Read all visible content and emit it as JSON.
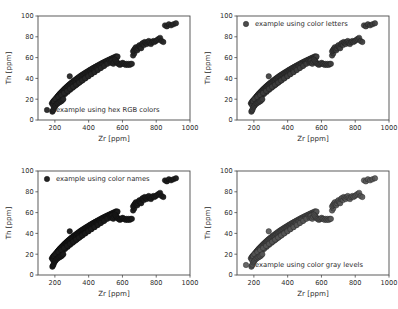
{
  "figure": {
    "background": "#ffffff",
    "rows": 2,
    "cols": 2,
    "axis_color": "#4a4a4a",
    "text_color": "#2b2b2b"
  },
  "chart_data": [
    {
      "type": "scatter",
      "panel": "top-left",
      "title": "",
      "xlabel": "Zr [ppm]",
      "ylabel": "Th [ppm]",
      "xlim": [
        100,
        1000
      ],
      "ylim": [
        0,
        100
      ],
      "xticks": [
        200,
        400,
        600,
        800,
        1000
      ],
      "yticks": [
        0,
        20,
        40,
        60,
        80,
        100
      ],
      "grid": false,
      "legend_position": "lower-left",
      "legend": "example using hex RGB colors",
      "marker": "o",
      "marker_color": "#262626",
      "marker_edge_color": "#141414",
      "marker_size": 4.2,
      "marker_alpha": 0.95
    },
    {
      "type": "scatter",
      "panel": "top-right",
      "title": "",
      "xlabel": "Zr [ppm]",
      "ylabel": "Th [ppm]",
      "xlim": [
        100,
        1000
      ],
      "ylim": [
        0,
        100
      ],
      "xticks": [
        200,
        400,
        600,
        800,
        1000
      ],
      "yticks": [
        0,
        20,
        40,
        60,
        80,
        100
      ],
      "grid": false,
      "legend_position": "upper-left",
      "legend": "example using color letters",
      "marker": "o",
      "marker_color": "#3d3d3d",
      "marker_edge_color": "#1c1c1c",
      "marker_size": 4.2,
      "marker_alpha": 0.92
    },
    {
      "type": "scatter",
      "panel": "bottom-left",
      "title": "",
      "xlabel": "Zr [ppm]",
      "ylabel": "Th [ppm]",
      "xlim": [
        100,
        1000
      ],
      "ylim": [
        0,
        100
      ],
      "xticks": [
        200,
        400,
        600,
        800,
        1000
      ],
      "yticks": [
        0,
        20,
        40,
        60,
        80,
        100
      ],
      "grid": false,
      "legend_position": "upper-left",
      "legend": "example using color names",
      "marker": "o",
      "marker_color": "#1a1a1a",
      "marker_edge_color": "#0d0d0d",
      "marker_size": 4.2,
      "marker_alpha": 0.96
    },
    {
      "type": "scatter",
      "panel": "bottom-right",
      "title": "",
      "xlabel": "Zr [ppm]",
      "ylabel": "Th [ppm]",
      "xlim": [
        100,
        1000
      ],
      "ylim": [
        0,
        100
      ],
      "xticks": [
        200,
        400,
        600,
        800,
        1000
      ],
      "yticks": [
        0,
        20,
        40,
        60,
        80,
        100
      ],
      "grid": false,
      "legend_position": "lower-left",
      "legend": "example using color gray levels",
      "marker": "o",
      "marker_color": "#555555",
      "marker_edge_color": "#262626",
      "marker_size": 4.2,
      "marker_alpha": 0.9
    }
  ],
  "points": {
    "x": [
      182,
      186,
      188,
      190,
      191,
      193,
      195,
      196,
      197,
      199,
      200,
      201,
      203,
      204,
      205,
      206,
      208,
      209,
      210,
      211,
      213,
      214,
      215,
      216,
      218,
      219,
      220,
      221,
      223,
      224,
      225,
      227,
      228,
      229,
      231,
      232,
      234,
      235,
      237,
      238,
      240,
      241,
      243,
      244,
      246,
      247,
      249,
      250,
      252,
      253,
      255,
      257,
      258,
      260,
      261,
      263,
      265,
      266,
      268,
      270,
      271,
      273,
      275,
      276,
      278,
      280,
      282,
      283,
      285,
      287,
      289,
      291,
      292,
      294,
      296,
      298,
      300,
      302,
      304,
      306,
      308,
      310,
      312,
      314,
      316,
      318,
      320,
      322,
      324,
      326,
      328,
      330,
      332,
      334,
      336,
      338,
      340,
      343,
      345,
      347,
      349,
      351,
      354,
      356,
      358,
      360,
      363,
      365,
      367,
      370,
      372,
      374,
      377,
      379,
      382,
      384,
      386,
      389,
      391,
      394,
      396,
      399,
      401,
      404,
      406,
      409,
      411,
      414,
      417,
      419,
      422,
      424,
      427,
      430,
      432,
      435,
      438,
      440,
      443,
      446,
      449,
      451,
      454,
      457,
      460,
      463,
      466,
      468,
      471,
      474,
      477,
      480,
      483,
      486,
      489,
      492,
      495,
      498,
      501,
      504,
      507,
      511,
      514,
      517,
      520,
      523,
      526,
      530,
      533,
      536,
      540,
      543,
      546,
      550,
      553,
      557,
      560,
      564,
      567,
      571,
      190,
      205,
      218,
      232,
      246,
      260,
      275,
      290,
      305,
      320,
      336,
      351,
      367,
      383,
      399,
      415,
      431,
      448,
      464,
      481,
      196,
      212,
      228,
      244,
      261,
      277,
      294,
      311,
      328,
      345,
      362,
      379,
      397,
      414,
      432,
      450,
      468,
      486,
      504,
      522,
      203,
      220,
      237,
      254,
      272,
      289,
      307,
      325,
      343,
      361,
      379,
      398,
      416,
      435,
      454,
      473,
      492,
      511,
      530,
      549,
      288,
      530,
      534,
      538,
      542,
      546,
      551,
      556,
      560,
      565,
      570,
      575,
      580,
      585,
      590,
      596,
      601,
      607,
      613,
      619,
      625,
      631,
      637,
      643,
      650,
      656,
      663,
      670,
      663,
      668,
      672,
      676,
      680,
      684,
      688,
      692,
      697,
      701,
      706,
      711,
      716,
      721,
      727,
      732,
      738,
      744,
      750,
      756,
      762,
      769,
      776,
      783,
      790,
      798,
      806,
      814,
      823,
      832,
      842,
      852,
      863,
      875,
      888,
      902,
      917,
      185,
      188,
      192,
      196,
      200,
      204,
      209,
      213,
      218,
      223,
      228,
      233,
      238,
      244,
      250
    ],
    "y": [
      16,
      16,
      17,
      17,
      18,
      18,
      17,
      18,
      19,
      19,
      18,
      19,
      20,
      20,
      19,
      20,
      21,
      21,
      20,
      21,
      22,
      22,
      21,
      22,
      23,
      23,
      22,
      23,
      24,
      24,
      23,
      24,
      25,
      25,
      24,
      25,
      26,
      26,
      25,
      26,
      27,
      27,
      26,
      27,
      28,
      28,
      27,
      28,
      29,
      29,
      28,
      29,
      30,
      30,
      29,
      30,
      31,
      31,
      30,
      31,
      32,
      32,
      31,
      32,
      33,
      33,
      32,
      33,
      34,
      34,
      33,
      34,
      35,
      35,
      34,
      35,
      36,
      36,
      35,
      36,
      37,
      37,
      36,
      37,
      38,
      38,
      37,
      38,
      39,
      39,
      38,
      39,
      40,
      40,
      39,
      40,
      41,
      41,
      40,
      41,
      42,
      42,
      41,
      42,
      43,
      43,
      42,
      43,
      44,
      44,
      43,
      44,
      45,
      45,
      44,
      45,
      46,
      46,
      45,
      46,
      47,
      47,
      46,
      47,
      48,
      48,
      47,
      48,
      49,
      49,
      48,
      49,
      50,
      50,
      49,
      50,
      51,
      51,
      50,
      51,
      52,
      52,
      51,
      52,
      53,
      53,
      52,
      53,
      54,
      54,
      53,
      54,
      55,
      55,
      54,
      55,
      56,
      56,
      55,
      56,
      57,
      57,
      56,
      57,
      58,
      58,
      57,
      58,
      59,
      59,
      58,
      59,
      60,
      60,
      59,
      60,
      61,
      61,
      60,
      61,
      14,
      17,
      19,
      21,
      23,
      25,
      27,
      29,
      31,
      33,
      35,
      37,
      39,
      41,
      43,
      45,
      47,
      49,
      51,
      53,
      18,
      20,
      22,
      24,
      26,
      28,
      30,
      32,
      34,
      36,
      38,
      40,
      42,
      44,
      46,
      48,
      50,
      52,
      54,
      56,
      20,
      22,
      24,
      26,
      28,
      30,
      32,
      34,
      36,
      38,
      40,
      42,
      44,
      46,
      48,
      50,
      52,
      54,
      56,
      58,
      42,
      55,
      56,
      57,
      55,
      54,
      56,
      58,
      57,
      56,
      55,
      54,
      54,
      53,
      54,
      54,
      55,
      54,
      54,
      53,
      54,
      53,
      54,
      53,
      54,
      54,
      62,
      64,
      66,
      67,
      68,
      69,
      70,
      68,
      67,
      69,
      71,
      72,
      70,
      69,
      73,
      74,
      72,
      75,
      74,
      73,
      75,
      76,
      74,
      73,
      75,
      76,
      75,
      76,
      77,
      78,
      79,
      76,
      75,
      91,
      90,
      92,
      91,
      92,
      93,
      8,
      9,
      10,
      12,
      13,
      14,
      15,
      16,
      16,
      17,
      17,
      18,
      18,
      19,
      20
    ]
  }
}
